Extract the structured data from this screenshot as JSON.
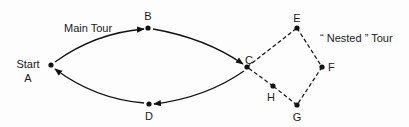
{
  "diagram": {
    "title_main": "Main Tour",
    "title_nested": "“ Nested ” Tour",
    "start_label": "Start",
    "nodes": [
      {
        "id": "A",
        "label": "A",
        "x": 51,
        "y": 65
      },
      {
        "id": "B",
        "label": "B",
        "x": 148,
        "y": 28
      },
      {
        "id": "C",
        "label": "C",
        "x": 247,
        "y": 67
      },
      {
        "id": "D",
        "label": "D",
        "x": 149,
        "y": 104
      },
      {
        "id": "E",
        "label": "E",
        "x": 297,
        "y": 28
      },
      {
        "id": "F",
        "label": "F",
        "x": 322,
        "y": 67
      },
      {
        "id": "G",
        "label": "G",
        "x": 297,
        "y": 105
      },
      {
        "id": "H",
        "label": "H",
        "x": 273,
        "y": 86
      }
    ],
    "main_edges": [
      {
        "from": "A",
        "to": "B",
        "style": "solid",
        "arrow": "B"
      },
      {
        "from": "B",
        "to": "C",
        "style": "solid",
        "arrow": "C"
      },
      {
        "from": "C",
        "to": "D",
        "style": "solid",
        "arrow": "D"
      },
      {
        "from": "D",
        "to": "A",
        "style": "solid",
        "arrow": "A"
      }
    ],
    "nested_edges": [
      {
        "from": "C",
        "to": "E",
        "style": "dashed"
      },
      {
        "from": "E",
        "to": "F",
        "style": "dashed"
      },
      {
        "from": "F",
        "to": "G",
        "style": "dashed"
      },
      {
        "from": "G",
        "to": "H",
        "style": "dashed"
      },
      {
        "from": "H",
        "to": "C",
        "style": "dashed"
      }
    ],
    "colors": {
      "ink": "#111111",
      "background": "#fdfdfd"
    }
  }
}
